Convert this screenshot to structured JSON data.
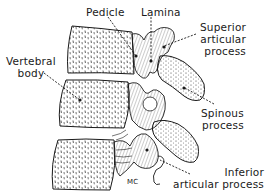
{
  "figure": {
    "colors": {
      "ink": "#1a1a1a",
      "background": "#ffffff"
    },
    "labels": {
      "pedicle": [
        "Pedicle"
      ],
      "lamina": [
        "Lamina"
      ],
      "superior_articular_process": [
        "Superior",
        "articular",
        "process"
      ],
      "vertebral_body": [
        "Vertebral",
        "body"
      ],
      "spinous_process": [
        "Spinous",
        "process"
      ],
      "inferior_articular_process": [
        "Inferior",
        "articular process"
      ]
    },
    "signature": "MC"
  }
}
